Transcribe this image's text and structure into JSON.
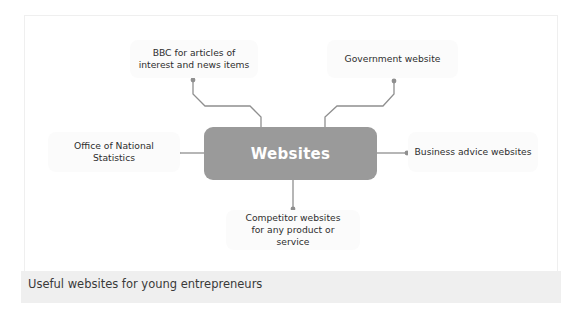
{
  "diagram": {
    "center": {
      "label": "Websites",
      "color": "#9a9a9a"
    },
    "nodes": [
      {
        "id": "bbc",
        "label": "BBC for articles of interest and news items"
      },
      {
        "id": "government",
        "label": "Government website"
      },
      {
        "id": "ons",
        "label": "Office of National Statistics"
      },
      {
        "id": "business-advice",
        "label": "Business advice websites"
      },
      {
        "id": "competitor",
        "label": "Competitor websites for any product or service"
      }
    ],
    "connector_color": "#8a8a8a"
  },
  "caption": "Useful websites for young entrepreneurs"
}
